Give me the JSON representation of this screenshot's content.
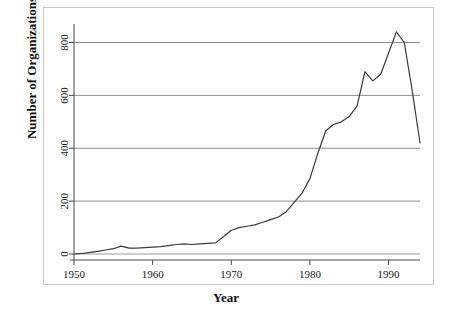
{
  "chart_data": {
    "type": "line",
    "title": "",
    "xlabel": "Year",
    "ylabel": "Number of Organizations",
    "xlim": [
      1950,
      1994
    ],
    "ylim": [
      0,
      870
    ],
    "xticks": [
      1950,
      1960,
      1970,
      1980,
      1990
    ],
    "xticklabels": [
      "1950",
      "1960",
      "1970",
      "1980",
      "1990"
    ],
    "yticks": [
      0,
      200,
      400,
      600,
      800
    ],
    "yticklabels": [
      "0",
      "200",
      "400",
      "600",
      "800"
    ],
    "grid": "horizontal",
    "legend": "none",
    "series": [
      {
        "name": "Number of Organizations",
        "color": "#3a3a3a",
        "x": [
          1950,
          1951,
          1952,
          1953,
          1954,
          1955,
          1956,
          1957,
          1958,
          1959,
          1960,
          1961,
          1962,
          1963,
          1964,
          1965,
          1966,
          1967,
          1968,
          1969,
          1970,
          1971,
          1972,
          1973,
          1974,
          1975,
          1976,
          1977,
          1978,
          1979,
          1980,
          1981,
          1982,
          1983,
          1984,
          1985,
          1986,
          1987,
          1988,
          1989,
          1990,
          1991,
          1992,
          1993,
          1994
        ],
        "values": [
          0,
          2,
          6,
          10,
          15,
          20,
          30,
          22,
          22,
          24,
          26,
          28,
          32,
          36,
          38,
          36,
          38,
          40,
          42,
          65,
          90,
          100,
          105,
          110,
          120,
          130,
          140,
          160,
          195,
          230,
          285,
          380,
          465,
          490,
          500,
          520,
          560,
          690,
          655,
          680,
          760,
          840,
          800,
          620,
          420
        ]
      }
    ]
  },
  "axis": {
    "y_title": "Number of Organizations",
    "x_title": "Year"
  }
}
